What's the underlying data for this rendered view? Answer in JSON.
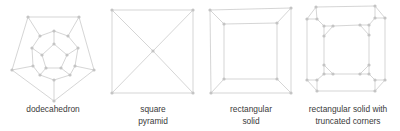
{
  "colors": {
    "edge": "#d0d0d0",
    "vertex": "#c4c4c4",
    "text": "#3a3a3a",
    "background": "#ffffff"
  },
  "figures": [
    {
      "id": "dodecahedron",
      "label_lines": [
        "dodecahedron"
      ],
      "label_x": 53,
      "label_y": 103,
      "vertices": [
        [
          28,
          17
        ],
        [
          79,
          17
        ],
        [
          94,
          70
        ],
        [
          54,
          101
        ],
        [
          12,
          70
        ],
        [
          40,
          36
        ],
        [
          54,
          31
        ],
        [
          68,
          36
        ],
        [
          78,
          48
        ],
        [
          75,
          66
        ],
        [
          70,
          75
        ],
        [
          54,
          80
        ],
        [
          40,
          75
        ],
        [
          33,
          66
        ],
        [
          32,
          48
        ],
        [
          54,
          44
        ],
        [
          67,
          55
        ],
        [
          61,
          68
        ],
        [
          46,
          68
        ],
        [
          42,
          55
        ]
      ],
      "edges": [
        [
          0,
          1
        ],
        [
          1,
          2
        ],
        [
          2,
          3
        ],
        [
          3,
          4
        ],
        [
          4,
          0
        ],
        [
          0,
          5
        ],
        [
          1,
          7
        ],
        [
          2,
          9
        ],
        [
          3,
          11
        ],
        [
          4,
          13
        ],
        [
          5,
          6
        ],
        [
          6,
          7
        ],
        [
          7,
          8
        ],
        [
          8,
          9
        ],
        [
          9,
          10
        ],
        [
          10,
          11
        ],
        [
          11,
          12
        ],
        [
          12,
          13
        ],
        [
          13,
          14
        ],
        [
          14,
          5
        ],
        [
          6,
          15
        ],
        [
          8,
          16
        ],
        [
          10,
          17
        ],
        [
          12,
          18
        ],
        [
          14,
          19
        ],
        [
          15,
          16
        ],
        [
          16,
          17
        ],
        [
          17,
          18
        ],
        [
          18,
          19
        ],
        [
          19,
          15
        ]
      ]
    },
    {
      "id": "square-pyramid",
      "label_lines": [
        "square",
        "pyramid"
      ],
      "label_x": 153,
      "label_y": 103,
      "vertices": [
        [
          112,
          10
        ],
        [
          193,
          10
        ],
        [
          193,
          93
        ],
        [
          112,
          93
        ],
        [
          153,
          51
        ]
      ],
      "edges": [
        [
          0,
          1
        ],
        [
          1,
          2
        ],
        [
          2,
          3
        ],
        [
          3,
          0
        ],
        [
          0,
          4
        ],
        [
          1,
          4
        ],
        [
          2,
          4
        ],
        [
          3,
          4
        ]
      ]
    },
    {
      "id": "rectangular-solid",
      "label_lines": [
        "rectangular",
        "solid"
      ],
      "label_x": 251,
      "label_y": 103,
      "vertices": [
        [
          210,
          10
        ],
        [
          291,
          8
        ],
        [
          291,
          93
        ],
        [
          211,
          93
        ],
        [
          224,
          24
        ],
        [
          277,
          23
        ],
        [
          277,
          79
        ],
        [
          224,
          79
        ]
      ],
      "edges": [
        [
          0,
          1
        ],
        [
          1,
          2
        ],
        [
          2,
          3
        ],
        [
          3,
          0
        ],
        [
          4,
          5
        ],
        [
          5,
          6
        ],
        [
          6,
          7
        ],
        [
          7,
          4
        ],
        [
          0,
          4
        ],
        [
          1,
          5
        ],
        [
          2,
          6
        ],
        [
          3,
          7
        ]
      ]
    },
    {
      "id": "truncated-rectangular-solid",
      "label_lines": [
        "rectangular solid with",
        "truncated corners"
      ],
      "label_x": 348,
      "label_y": 103,
      "vertices": [
        [
          316,
          7
        ],
        [
          307,
          19
        ],
        [
          317,
          19
        ],
        [
          375,
          6
        ],
        [
          385,
          18
        ],
        [
          375,
          18
        ],
        [
          385,
          80
        ],
        [
          375,
          80
        ],
        [
          375,
          91
        ],
        [
          317,
          91
        ],
        [
          307,
          80
        ],
        [
          317,
          80
        ],
        [
          324,
          26
        ],
        [
          333,
          26
        ],
        [
          324,
          36
        ],
        [
          360,
          25
        ],
        [
          369,
          25
        ],
        [
          369,
          35
        ],
        [
          369,
          65
        ],
        [
          369,
          74
        ],
        [
          360,
          74
        ],
        [
          333,
          74
        ],
        [
          324,
          74
        ],
        [
          324,
          65
        ]
      ],
      "edges": [
        [
          0,
          1
        ],
        [
          1,
          2
        ],
        [
          2,
          0
        ],
        [
          3,
          4
        ],
        [
          4,
          5
        ],
        [
          5,
          3
        ],
        [
          6,
          7
        ],
        [
          7,
          8
        ],
        [
          8,
          6
        ],
        [
          9,
          10
        ],
        [
          10,
          11
        ],
        [
          11,
          9
        ],
        [
          12,
          13
        ],
        [
          13,
          14
        ],
        [
          14,
          12
        ],
        [
          15,
          16
        ],
        [
          16,
          17
        ],
        [
          17,
          15
        ],
        [
          18,
          19
        ],
        [
          19,
          20
        ],
        [
          20,
          18
        ],
        [
          21,
          22
        ],
        [
          22,
          23
        ],
        [
          23,
          21
        ],
        [
          0,
          3
        ],
        [
          4,
          6
        ],
        [
          8,
          9
        ],
        [
          10,
          1
        ],
        [
          13,
          15
        ],
        [
          17,
          18
        ],
        [
          20,
          21
        ],
        [
          23,
          14
        ],
        [
          2,
          12
        ],
        [
          5,
          16
        ],
        [
          7,
          19
        ],
        [
          11,
          22
        ]
      ]
    }
  ]
}
